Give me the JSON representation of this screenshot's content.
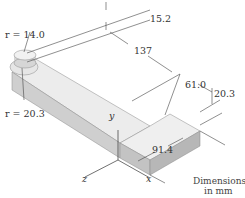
{
  "diagram": {
    "type": "isometric mechanical part drawing",
    "dimensions": [
      {
        "id": "boss_height",
        "label": "15.2"
      },
      {
        "id": "long_arm_length",
        "label": "137"
      },
      {
        "id": "short_arm_length",
        "label": "61.0"
      },
      {
        "id": "thickness",
        "label": "20.3"
      },
      {
        "id": "width",
        "label": "91.4"
      }
    ],
    "radii": [
      {
        "id": "boss_radius",
        "label": "r = 14.0"
      },
      {
        "id": "end_radius",
        "label": "r = 20.3"
      }
    ],
    "axes": {
      "x": "x",
      "y": "y",
      "z": "z"
    },
    "units_note_line1": "Dimensions",
    "units_note_line2": "in mm",
    "colors": {
      "top_face": "#ececec",
      "side_face": "#cfcfcf",
      "front_face": "#bdbdbd",
      "lines": "#444444"
    }
  }
}
